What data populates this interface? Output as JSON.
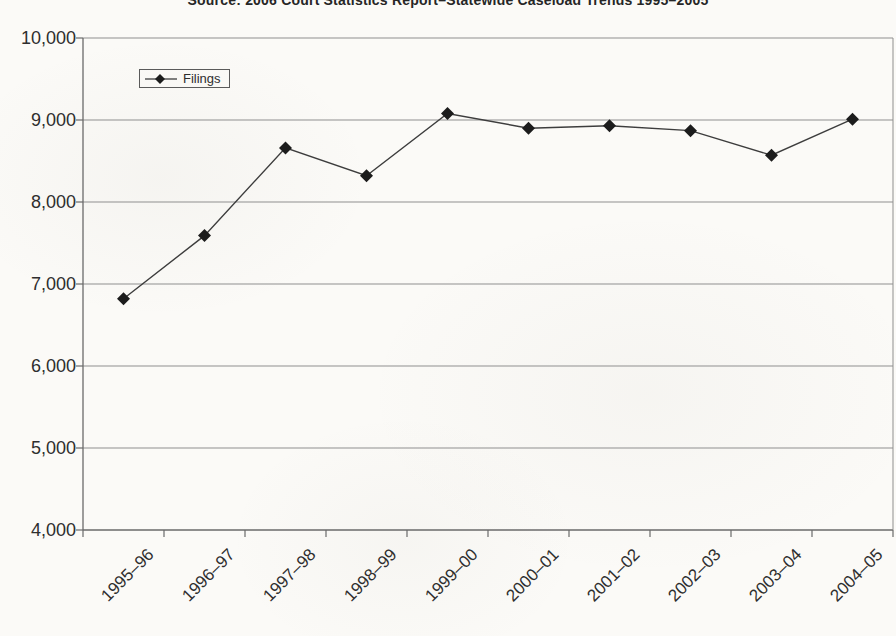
{
  "title": {
    "text": "Source: 2006 Court Statistics Report–Statewide Caseload Trends 1995–2005",
    "note": "title is partially cut off at the top edge of the image"
  },
  "legend": {
    "label": "Filings",
    "marker": "black-diamond-on-line"
  },
  "chart_data": {
    "type": "line",
    "title": "Source: 2006 Court Statistics Report–Statewide Caseload Trends 1995–2005",
    "categories": [
      "1995–96",
      "1996–97",
      "1997–98",
      "1998–99",
      "1999–00",
      "2000–01",
      "2001–02",
      "2002–03",
      "2003–04",
      "2004–05"
    ],
    "series": [
      {
        "name": "Filings",
        "marker": "diamond",
        "values": [
          6820,
          7590,
          8660,
          8320,
          9080,
          8900,
          8930,
          8870,
          8570,
          9010
        ]
      }
    ],
    "xlabel": "",
    "ylabel": "",
    "ylim": [
      4000,
      10000
    ],
    "ytick_step": 1000,
    "ytick_labels": [
      "4,000",
      "5,000",
      "6,000",
      "7,000",
      "8,000",
      "9,000",
      "10,000"
    ],
    "grid": true,
    "gridlines": "horizontal-every-1000",
    "legend_position": "inside-top-left",
    "x_tick_label_rotation_deg": 45,
    "colors": {
      "line": "#3d3d3d",
      "marker": "#1c1c1c",
      "grid": "#8f8f8f",
      "axis": "#6a6a6a",
      "text": "#2e2e2e",
      "background": "#fbfaf7",
      "legend_border": "#5a5a5a"
    }
  }
}
